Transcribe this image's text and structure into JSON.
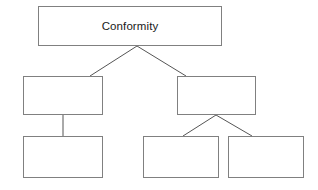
{
  "diagram": {
    "type": "hierarchy-tree",
    "title": "Conformity",
    "canvas": {
      "width": 318,
      "height": 190,
      "background": "#ffffff"
    },
    "style": {
      "box_border_color": "#808080",
      "connector_color": "#555555",
      "text_color": "#1a1a1a"
    },
    "nodes": [
      {
        "id": "root",
        "label": "Conformity",
        "level": 0,
        "empty": false
      },
      {
        "id": "left-mid",
        "label": "",
        "level": 1,
        "empty": true
      },
      {
        "id": "right-mid",
        "label": "",
        "level": 1,
        "empty": true
      },
      {
        "id": "left-bottom",
        "label": "",
        "level": 2,
        "empty": true
      },
      {
        "id": "bottom-a",
        "label": "",
        "level": 2,
        "empty": true
      },
      {
        "id": "bottom-b",
        "label": "",
        "level": 2,
        "empty": true
      }
    ],
    "connectors": [
      {
        "from": "root",
        "to": "left-mid",
        "kind": "diagonal"
      },
      {
        "from": "root",
        "to": "right-mid",
        "kind": "diagonal"
      },
      {
        "from": "left-mid",
        "to": "left-bottom",
        "kind": "vertical"
      },
      {
        "from": "right-mid",
        "to": "bottom-a",
        "kind": "diagonal"
      },
      {
        "from": "right-mid",
        "to": "bottom-b",
        "kind": "diagonal"
      }
    ]
  }
}
